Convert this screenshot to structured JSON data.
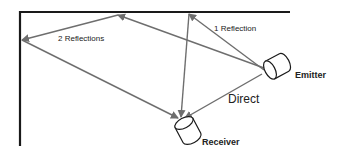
{
  "labels": {
    "two_reflections": "2 Reflections",
    "one_reflection": "1 Reflection",
    "emitter": "Emitter",
    "direct": "Direct",
    "receiver": "Receiver"
  },
  "colors": {
    "wall": "#1a1a1a",
    "ray": "#6e6e6e",
    "device_stroke": "#1a1a1a",
    "text": "#222222"
  }
}
